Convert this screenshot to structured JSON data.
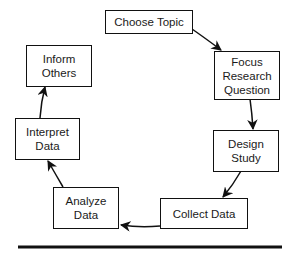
{
  "diagram": {
    "type": "cycle",
    "nodes": [
      {
        "id": "choose",
        "label": "Choose Topic"
      },
      {
        "id": "focus",
        "label": "Focus Research Question"
      },
      {
        "id": "design",
        "label": "Design Study"
      },
      {
        "id": "collect",
        "label": "Collect Data"
      },
      {
        "id": "analyze",
        "label": "Analyze Data"
      },
      {
        "id": "interpret",
        "label": "Interpret Data"
      },
      {
        "id": "inform",
        "label": "Inform Others"
      }
    ],
    "edges": [
      {
        "from": "choose",
        "to": "focus"
      },
      {
        "from": "focus",
        "to": "design"
      },
      {
        "from": "design",
        "to": "collect"
      },
      {
        "from": "collect",
        "to": "analyze"
      },
      {
        "from": "analyze",
        "to": "interpret"
      },
      {
        "from": "interpret",
        "to": "inform"
      }
    ],
    "colors": {
      "stroke": "#111111",
      "background": "#ffffff",
      "text": "#1a1a1a"
    }
  },
  "labels": {
    "choose_topic": "Choose Topic",
    "focus_l1": "Focus",
    "focus_l2": "Research",
    "focus_l3": "Question",
    "design_l1": "Design",
    "design_l2": "Study",
    "collect_data": "Collect Data",
    "analyze_l1": "Analyze",
    "analyze_l2": "Data",
    "interpret_l1": "Interpret",
    "interpret_l2": "Data",
    "inform_l1": "Inform",
    "inform_l2": "Others"
  }
}
